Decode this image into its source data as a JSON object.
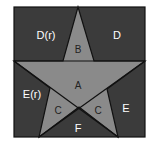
{
  "diagram": {
    "square": {
      "x": 14,
      "y": 7,
      "w": 131,
      "h": 130,
      "fill": "#3b3b3b",
      "stroke": "#111111"
    },
    "star": {
      "fill": "#8a8a8a",
      "stroke": "#111111",
      "points": "78,7 94,61 145,61 107,89 118,137 79,107 39,137 50,88 14,61 63,61"
    },
    "lines": [
      {
        "x1": 14,
        "y1": 61,
        "x2": 145,
        "y2": 61
      },
      {
        "x1": 14,
        "y1": 61,
        "x2": 118,
        "y2": 137
      },
      {
        "x1": 145,
        "y1": 61,
        "x2": 39,
        "y2": 137
      }
    ],
    "regions": [
      {
        "id": "D(r)",
        "label": "D(r)",
        "x": 46,
        "y": 36,
        "dark": false
      },
      {
        "id": "D",
        "label": "D",
        "x": 117,
        "y": 36,
        "dark": false
      },
      {
        "id": "B",
        "label": "B",
        "x": 78,
        "y": 50,
        "dark": true
      },
      {
        "id": "A",
        "label": "A",
        "x": 78,
        "y": 86,
        "dark": true
      },
      {
        "id": "E(r)",
        "label": "E(r)",
        "x": 32,
        "y": 95,
        "dark": false
      },
      {
        "id": "C-left",
        "label": "C",
        "x": 58,
        "y": 111,
        "dark": true
      },
      {
        "id": "C-right",
        "label": "C",
        "x": 98,
        "y": 111,
        "dark": true
      },
      {
        "id": "E",
        "label": "E",
        "x": 126,
        "y": 109,
        "dark": false
      },
      {
        "id": "F",
        "label": "F",
        "x": 78,
        "y": 129,
        "dark": false
      }
    ]
  }
}
